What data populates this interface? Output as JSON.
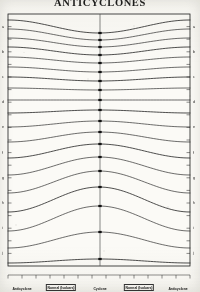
{
  "figure": {
    "title": "ANTICYCLONES",
    "ink_color": "#1d1d1d",
    "paper_color": "#fbfaf6",
    "frame": {
      "left": 8,
      "right": 190,
      "top": 14,
      "bottom": 266
    },
    "center_axis_x": 100
  },
  "bottom_labels": [
    {
      "text": "Anticyclone",
      "x": 22,
      "boxed": false
    },
    {
      "text": "Normal (Isobars)",
      "x": 61,
      "boxed": true
    },
    {
      "text": "Cyclone",
      "x": 100,
      "boxed": false
    },
    {
      "text": "Normal (Isobars)",
      "x": 139,
      "boxed": true
    },
    {
      "text": "Anticyclone",
      "x": 178,
      "boxed": false
    }
  ],
  "left_axis_labels": [
    "a",
    "b",
    "c",
    "d",
    "e",
    "f",
    "g",
    "h",
    "i",
    "j"
  ],
  "right_axis_labels": [
    "a",
    "b",
    "c",
    "d",
    "e",
    "f",
    "g",
    "h",
    "i",
    "j"
  ],
  "chart_data": {
    "type": "line",
    "title": "ANTICYCLONES",
    "xlabel": "",
    "ylabel": "",
    "grid": false,
    "legend": "none",
    "xlim": [
      0,
      1
    ],
    "ylim": [
      0,
      1
    ],
    "x": [
      0,
      0.08,
      0.17,
      0.26,
      0.35,
      0.43,
      0.5,
      0.57,
      0.65,
      0.74,
      0.83,
      0.92,
      1
    ],
    "series": [
      {
        "name": "surface-1",
        "edge_y": 20,
        "center_y": 33,
        "amplitude": -13
      },
      {
        "name": "surface-2",
        "edge_y": 29,
        "center_y": 40,
        "amplitude": -11
      },
      {
        "name": "surface-3",
        "edge_y": 38,
        "center_y": 47,
        "amplitude": -9
      },
      {
        "name": "surface-4",
        "edge_y": 47,
        "center_y": 55,
        "amplitude": -8
      },
      {
        "name": "surface-5",
        "edge_y": 57,
        "center_y": 63,
        "amplitude": -6
      },
      {
        "name": "surface-6",
        "edge_y": 67,
        "center_y": 72,
        "amplitude": -5
      },
      {
        "name": "surface-7",
        "edge_y": 77,
        "center_y": 81,
        "amplitude": -4
      },
      {
        "name": "surface-8",
        "edge_y": 88,
        "center_y": 90,
        "amplitude": -2
      },
      {
        "name": "surface-9",
        "edge_y": 100,
        "center_y": 100,
        "amplitude": 0
      },
      {
        "name": "surface-10",
        "edge_y": 113,
        "center_y": 110,
        "amplitude": 3
      },
      {
        "name": "surface-11",
        "edge_y": 127,
        "center_y": 121,
        "amplitude": 6
      },
      {
        "name": "surface-12",
        "edge_y": 142,
        "center_y": 132,
        "amplitude": 10
      },
      {
        "name": "surface-13",
        "edge_y": 158,
        "center_y": 144,
        "amplitude": 14
      },
      {
        "name": "surface-14",
        "edge_y": 175,
        "center_y": 157,
        "amplitude": 18
      },
      {
        "name": "surface-15",
        "edge_y": 193,
        "center_y": 171,
        "amplitude": 22
      },
      {
        "name": "surface-16",
        "edge_y": 212,
        "center_y": 187,
        "amplitude": 25
      },
      {
        "name": "surface-17",
        "edge_y": 231,
        "center_y": 206,
        "amplitude": 25
      },
      {
        "name": "surface-18",
        "edge_y": 248,
        "center_y": 232,
        "amplitude": 16
      },
      {
        "name": "surface-19",
        "edge_y": 263,
        "center_y": 259,
        "amplitude": 4
      }
    ],
    "tick_count_horizontal": 13,
    "tick_count_vertical": 20
  }
}
